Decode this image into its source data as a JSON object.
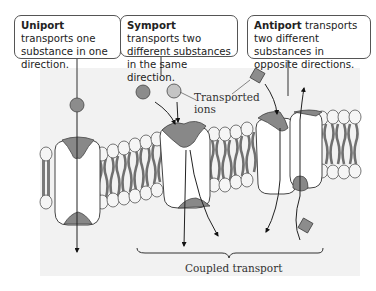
{
  "callouts": {
    "uniport": {
      "term": "Uniport",
      "text": " transports one substance in one direction."
    },
    "symport": {
      "term": "Symport",
      "text": " transports two different substances in the same direction."
    },
    "antiport": {
      "term": "Antiport",
      "text": " transports two different substances in opposite directions."
    }
  },
  "labels": {
    "transported_ions": "Transported ions",
    "transported_ions_line1": "Transported",
    "transported_ions_line2": "ions",
    "coupled_transport": "Coupled transport"
  },
  "colors": {
    "protein_fill": "#808080",
    "ion_fill": "#8c8c8c",
    "lipid_tail": "#7a7a7a",
    "lipid_head": "#f4f4f4",
    "panel_bg": "#f3f3f3",
    "outline": "#333333"
  }
}
